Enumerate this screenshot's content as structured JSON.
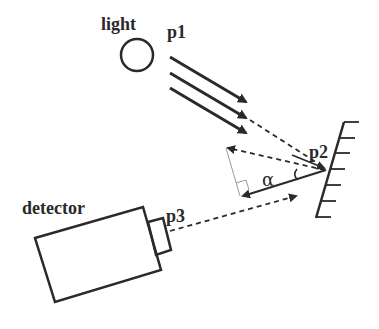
{
  "diagram": {
    "type": "optical-reflection-setup",
    "labels": {
      "light": "light",
      "p1": "p1",
      "p2": "p2",
      "p3": "p3",
      "detector": "detector",
      "angle": "α"
    },
    "components": [
      {
        "id": "light-source",
        "shape": "circle",
        "label": "light"
      },
      {
        "id": "incident-rays",
        "shape": "three parallel solid arrows",
        "label": "p1"
      },
      {
        "id": "mirror",
        "shape": "hatched line",
        "label": "p2"
      },
      {
        "id": "detector",
        "shape": "rectangle with small aperture box",
        "label": "detector"
      },
      {
        "id": "detector-aperture",
        "label": "p3"
      }
    ],
    "connections": [
      {
        "from": "incident-rays",
        "to": "mirror",
        "style": "dashed"
      },
      {
        "from": "mirror",
        "to": "upper-left",
        "style": "dashed arrow (reflected)"
      },
      {
        "from": "mirror",
        "to": "lower-left",
        "style": "solid arrow (normal/reference) with angle α"
      },
      {
        "from": "detector-aperture",
        "to": "mirror",
        "style": "dashed arrow"
      }
    ],
    "colors": {
      "stroke": "#2a2a2a",
      "light_stroke": "#9a9a9a",
      "background": "#ffffff"
    }
  }
}
